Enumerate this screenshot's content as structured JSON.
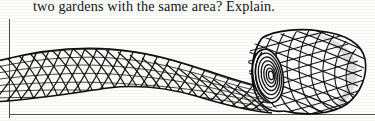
{
  "page": {
    "background_color": "#fdfdfc",
    "ink_color": "#141414"
  },
  "question": {
    "text": "two gardens with the same area? Explain."
  },
  "rules": {
    "vertical_margin_line": "page-margin-rule",
    "horizontal_footer_line": "page-footer-rule",
    "color": "#4a4a4a"
  },
  "illustration": {
    "caption": "",
    "subject": "roll of garden mesh netting, partially unrolled",
    "description": "A long sheet of diamond-pattern wire mesh lies flat at the left, twists through a narrow waist near the middle, and is wound into a cylindrical roll at the right whose open end shows concentric spiral layers.",
    "line_color": "#111111",
    "fill_color": "#ffffff",
    "parts": [
      {
        "name": "flat-mesh-sheet",
        "label": "unrolled mesh sheet"
      },
      {
        "name": "mesh-twist-waist",
        "label": "twisted narrow section"
      },
      {
        "name": "mesh-cylinder-roll",
        "label": "rolled cylinder of mesh"
      },
      {
        "name": "roll-spiral-end",
        "label": "spiral cross-section of roll end"
      }
    ]
  }
}
